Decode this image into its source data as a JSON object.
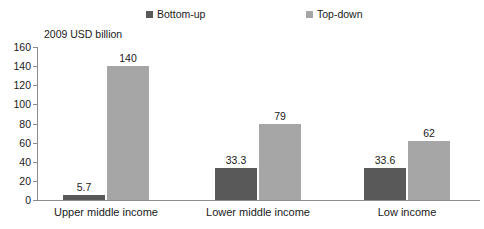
{
  "chart_data": {
    "type": "bar",
    "title": "",
    "subtitle": "",
    "xlabel": "",
    "ylabel": "2009 USD billion",
    "ylim": [
      0,
      160
    ],
    "ytick_step": 20,
    "yticks": [
      160,
      140,
      120,
      100,
      80,
      60,
      40,
      20,
      0
    ],
    "grid": false,
    "legend_position": "top",
    "categories": [
      "Upper middle income",
      "Lower middle income",
      "Low income"
    ],
    "series": [
      {
        "name": "Bottom-up",
        "color": "#595959",
        "values": [
          5.7,
          33.3,
          33.6
        ],
        "labels": [
          "5.7",
          "33.3",
          "33.6"
        ]
      },
      {
        "name": "Top-down",
        "color": "#a6a6a6",
        "values": [
          140,
          79,
          62
        ],
        "labels": [
          "140",
          "79",
          "62"
        ]
      }
    ]
  },
  "legend": {
    "items": [
      {
        "label": "Bottom-up",
        "color": "#595959"
      },
      {
        "label": "Top-down",
        "color": "#a6a6a6"
      }
    ]
  },
  "axis": {
    "unit_label": "2009 USD billion",
    "y_labels": [
      "160",
      "140",
      "120",
      "100",
      "80",
      "60",
      "40",
      "20",
      "0"
    ],
    "x_labels": [
      "Upper middle income",
      "Lower middle income",
      "Low income"
    ]
  },
  "colors": {
    "bottom_up": "#595959",
    "top_down": "#a6a6a6",
    "axis": "#8c8c8c",
    "text": "#1a1a1a",
    "background": "#ffffff"
  }
}
